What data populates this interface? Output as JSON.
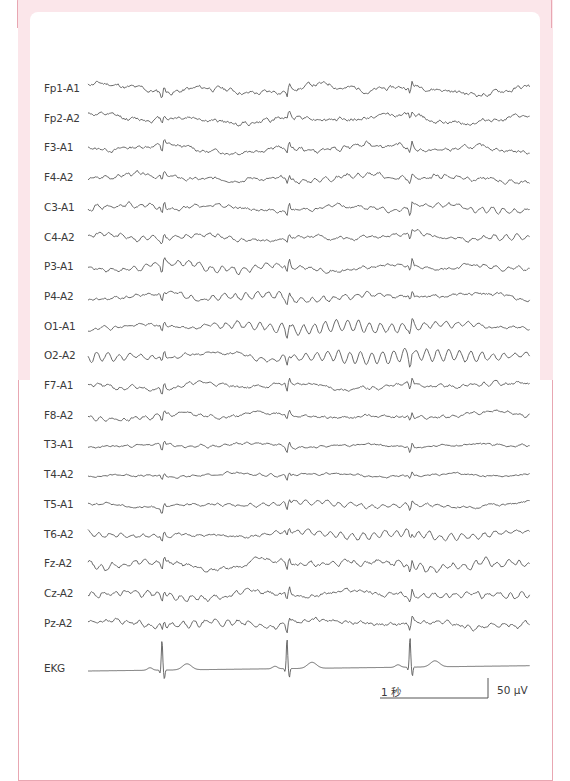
{
  "chart_data": {
    "type": "line",
    "title": "",
    "x_start_px": 88,
    "x_end_px": 530,
    "first_row_y": 89,
    "row_spacing": 29.7,
    "artifact_x": [
      162,
      287,
      410
    ],
    "channels": [
      {
        "label": "Fp1-A1",
        "amp": 3.2,
        "alpha": 0.6,
        "spike": 7,
        "seed": 11
      },
      {
        "label": "Fp2-A2",
        "amp": 3.0,
        "alpha": 0.8,
        "spike": 5,
        "seed": 12
      },
      {
        "label": "F3-A1",
        "amp": 2.6,
        "alpha": 1.6,
        "spike": 7,
        "seed": 13
      },
      {
        "label": "F4-A2",
        "amp": 2.6,
        "alpha": 1.8,
        "spike": 5,
        "seed": 14
      },
      {
        "label": "C3-A1",
        "amp": 2.2,
        "alpha": 2.0,
        "spike": 7,
        "seed": 15
      },
      {
        "label": "C4-A2",
        "amp": 2.2,
        "alpha": 2.0,
        "spike": 5,
        "seed": 16
      },
      {
        "label": "P3-A1",
        "amp": 2.2,
        "alpha": 2.8,
        "spike": 7,
        "seed": 17
      },
      {
        "label": "P4-A2",
        "amp": 2.2,
        "alpha": 3.0,
        "spike": 5,
        "seed": 18
      },
      {
        "label": "O1-A1",
        "amp": 1.8,
        "alpha": 5.5,
        "spike": 6,
        "seed": 19
      },
      {
        "label": "O2-A2",
        "amp": 1.8,
        "alpha": 6.5,
        "spike": 6,
        "seed": 20
      },
      {
        "label": "F7-A1",
        "amp": 2.2,
        "alpha": 1.4,
        "spike": 7,
        "seed": 21
      },
      {
        "label": "F8-A2",
        "amp": 2.0,
        "alpha": 1.2,
        "spike": 5,
        "seed": 22
      },
      {
        "label": "T3-A1",
        "amp": 1.4,
        "alpha": 0.8,
        "spike": 6,
        "seed": 23
      },
      {
        "label": "T4-A2",
        "amp": 1.3,
        "alpha": 0.8,
        "spike": 4,
        "seed": 24
      },
      {
        "label": "T5-A1",
        "amp": 1.6,
        "alpha": 2.0,
        "spike": 6,
        "seed": 25
      },
      {
        "label": "T6-A2",
        "amp": 1.8,
        "alpha": 3.6,
        "spike": 5,
        "seed": 26
      },
      {
        "label": "Fz-A2",
        "amp": 2.8,
        "alpha": 2.8,
        "spike": 7,
        "seed": 27
      },
      {
        "label": "Cz-A2",
        "amp": 2.6,
        "alpha": 2.6,
        "spike": 7,
        "seed": 28
      },
      {
        "label": "Pz-A2",
        "amp": 2.6,
        "alpha": 2.6,
        "spike": 7,
        "seed": 29
      }
    ],
    "ekg": {
      "label": "EKG",
      "y": 669,
      "r_peaks_x": [
        162,
        287,
        410
      ]
    },
    "scale_bar": {
      "time_label": "1 秒",
      "amplitude_label": "50 μV",
      "x1": 380,
      "x2": 488,
      "y": 698,
      "v_top": 678
    }
  },
  "colors": {
    "trace": "#5a5a5a",
    "frame_border": "#e8a7b2",
    "frame_fill": "#fbe6ea"
  }
}
